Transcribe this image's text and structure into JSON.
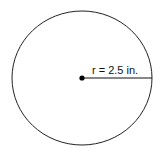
{
  "diagram": {
    "shape": "circle",
    "radius_label": "r = 2.5 in.",
    "stroke_color": "#222222",
    "center_dot_color": "#000000"
  }
}
